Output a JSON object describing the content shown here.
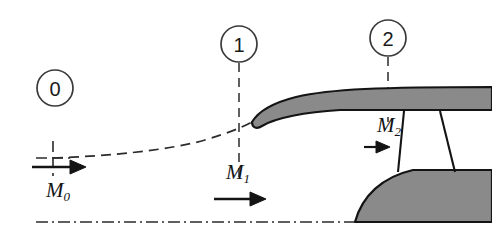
{
  "figure": {
    "background_color": "#ffffff",
    "line_color": "#1a1a1a",
    "shade_fill": "#8a8a8a"
  },
  "stations": [
    {
      "id": "station-0",
      "label": "0",
      "cx": 55,
      "cy": 88,
      "r": 18
    },
    {
      "id": "station-1",
      "label": "1",
      "cx": 239,
      "cy": 44,
      "r": 18
    },
    {
      "id": "station-2",
      "label": "2",
      "cx": 388,
      "cy": 38,
      "r": 18
    }
  ],
  "mach_labels": [
    {
      "id": "mach-0",
      "symbol": "M",
      "subscript": "0",
      "x": 46,
      "y": 188
    },
    {
      "id": "mach-1",
      "symbol": "M",
      "subscript": "1",
      "x": 226,
      "y": 170
    },
    {
      "id": "mach-2",
      "symbol": "M",
      "subscript": "2",
      "x": 377,
      "y": 113
    }
  ],
  "annotations": {
    "streamline_note": "capture streamtube dashed boundary",
    "centerline_note": "engine axis dash-dot centerline",
    "cowl_note": "nacelle cowl cross-section",
    "spinner_note": "hub spinner cross-section",
    "blade_note": "fan blade / strut"
  }
}
